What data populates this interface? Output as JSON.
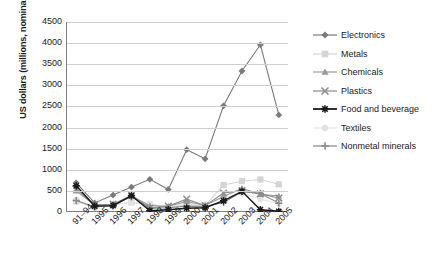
{
  "chart_data": {
    "type": "line",
    "title": "",
    "xlabel": "",
    "ylabel": "US dollars (millions, nominal)",
    "ylim": [
      0,
      4500
    ],
    "ytick_step": 500,
    "yticks": [
      4500,
      4000,
      3500,
      3000,
      2500,
      2000,
      1500,
      1000,
      500,
      0
    ],
    "grid": true,
    "legend_position": "right",
    "categories": [
      "91–94",
      "1995",
      "1996",
      "1997",
      "1998",
      "1999",
      "2000",
      "2001",
      "2002",
      "2003",
      "2004",
      "2005"
    ],
    "series": [
      {
        "name": "Electronics",
        "color": "#7b7b7b",
        "marker": "diamond",
        "values": [
          690,
          215,
          400,
          590,
          775,
          535,
          1475,
          1260,
          2515,
          3340,
          3960,
          2300
        ]
      },
      {
        "name": "Metals",
        "color": "#d4d4d4",
        "marker": "square",
        "values": [
          255,
          110,
          180,
          225,
          175,
          100,
          180,
          150,
          640,
          730,
          770,
          655
        ]
      },
      {
        "name": "Chemicals",
        "color": "#9a9a9a",
        "marker": "triangle",
        "values": [
          500,
          160,
          180,
          380,
          150,
          135,
          250,
          160,
          370,
          560,
          420,
          380
        ]
      },
      {
        "name": "Plastics",
        "color": "#8c8c8c",
        "marker": "cross-x",
        "values": [
          545,
          175,
          185,
          390,
          95,
          140,
          305,
          150,
          450,
          505,
          430,
          330
        ]
      },
      {
        "name": "Food and beverage",
        "color": "#1a1a1a",
        "marker": "star-x",
        "values": [
          620,
          140,
          150,
          390,
          30,
          55,
          90,
          100,
          265,
          490,
          55,
          15
        ]
      },
      {
        "name": "Textiles",
        "color": "#e3e3e3",
        "marker": "circle",
        "values": [
          290,
          120,
          170,
          230,
          195,
          120,
          210,
          180,
          330,
          445,
          310,
          195
        ]
      },
      {
        "name": "Nonmetal minerals",
        "color": "#888888",
        "marker": "plus",
        "values": [
          270,
          120,
          160,
          360,
          85,
          100,
          140,
          130,
          225,
          480,
          440,
          210
        ]
      }
    ]
  }
}
